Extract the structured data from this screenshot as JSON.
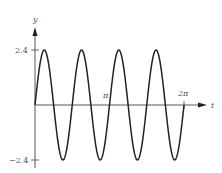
{
  "chart_data": {
    "type": "line",
    "title": "",
    "xlabel": "t",
    "ylabel": "y",
    "function": "y = 2.4 sin(4t)",
    "xlim": [
      0,
      6.2832
    ],
    "ylim": [
      -2.4,
      2.4
    ],
    "x_ticks": [
      {
        "value": 3.1416,
        "label": "π"
      },
      {
        "value": 6.2832,
        "label": "2π"
      }
    ],
    "y_ticks": [
      {
        "value": 2.4,
        "label": "2.4"
      },
      {
        "value": -2.4,
        "label": "−2.4"
      }
    ],
    "grid": false,
    "legend": null,
    "series": [
      {
        "name": "y(t)",
        "color": "#222222",
        "x": [
          0,
          0.3927,
          0.7854,
          1.1781,
          1.5708,
          1.9635,
          2.3562,
          2.7489,
          3.1416,
          3.5343,
          3.927,
          4.3197,
          4.7124,
          5.1051,
          5.4978,
          5.8905,
          6.2832
        ],
        "values": [
          0,
          2.4,
          0,
          -2.4,
          0,
          2.4,
          0,
          -2.4,
          0,
          2.4,
          0,
          -2.4,
          0,
          2.4,
          0,
          -2.4,
          0
        ]
      }
    ]
  },
  "labels": {
    "y_axis": "y",
    "x_axis": "t",
    "y_max": "2.4",
    "y_min": "−2.4",
    "pi": "π",
    "two_pi": "2π"
  }
}
